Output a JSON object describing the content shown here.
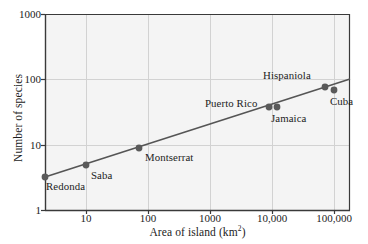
{
  "chart_data": {
    "type": "scatter",
    "title": "",
    "xlabel": "Area of island (km2)",
    "xlabel_base": "Area of island (km",
    "xlabel_sup": "2",
    "xlabel_tail": ")",
    "ylabel": "Number of species",
    "xscale": "log",
    "yscale": "log",
    "xlim": [
      3.16,
      316000
    ],
    "ylim": [
      1,
      1000
    ],
    "grid": true,
    "legend": "none",
    "xticks": [
      "10",
      "100",
      "1000",
      "10,000",
      "100,000"
    ],
    "xtick_values": [
      10,
      100,
      1000,
      10000,
      100000
    ],
    "yticks": [
      "1",
      "10",
      "100",
      "1000"
    ],
    "ytick_values": [
      1,
      10,
      100,
      1000
    ],
    "points": [
      {
        "label": "Redonda",
        "x": 3.2,
        "y": 3.0,
        "px": 45,
        "py": 177,
        "lx": 46,
        "ly": 181,
        "anchor": "left"
      },
      {
        "label": "Saba",
        "x": 10,
        "y": 4.5,
        "px": 86,
        "py": 165,
        "lx": 91,
        "ly": 170,
        "anchor": "left"
      },
      {
        "label": "Montserrat",
        "x": 73,
        "y": 8.5,
        "px": 139,
        "py": 148,
        "lx": 145,
        "ly": 152,
        "anchor": "left"
      },
      {
        "label": "Puerto Rico",
        "x": 8900,
        "y": 38,
        "px": 269,
        "py": 107,
        "lx": 205,
        "ly": 98,
        "anchor": "left"
      },
      {
        "label": "Jamaica",
        "x": 11400,
        "y": 38,
        "px": 277,
        "py": 107,
        "lx": 271,
        "ly": 113,
        "anchor": "left"
      },
      {
        "label": "Hispaniola",
        "x": 76000,
        "y": 72,
        "px": 325,
        "py": 87,
        "lx": 263,
        "ly": 70,
        "anchor": "left"
      },
      {
        "label": "Cuba",
        "x": 110000,
        "y": 66,
        "px": 334,
        "py": 90,
        "lx": 330,
        "ly": 96,
        "anchor": "left"
      }
    ],
    "trendline": {
      "x1": 45,
      "y1": 177,
      "x2": 350,
      "y2": 79
    },
    "colors": {
      "marker": "#5a5a5a",
      "line": "#555555",
      "grid": "#d2d2d2",
      "axis": "#3a3a3a",
      "plot_bg": "#f4f4f4",
      "text": "#1c1c1c"
    }
  }
}
